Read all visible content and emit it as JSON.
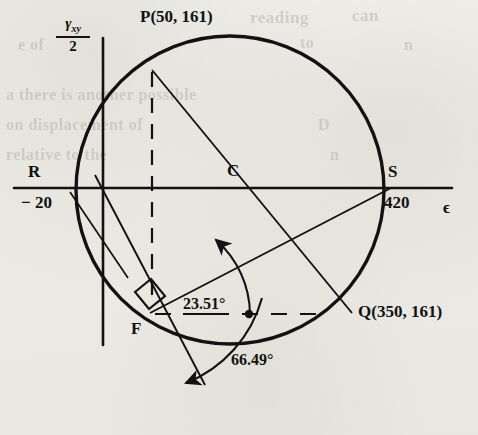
{
  "figure": {
    "kind": "mohr-circle-strain",
    "axis_labels": {
      "vertical_numerator": "γ",
      "vertical_numerator_sub": "xy",
      "vertical_denominator": "2",
      "horizontal": "ϵ"
    },
    "points": [
      {
        "id": "P",
        "label": "P(50, 161)",
        "x": 50,
        "y": 161,
        "px": 152,
        "py": 70
      },
      {
        "id": "Q",
        "label": "Q(350, 161)",
        "x": 350,
        "y": 161,
        "px": 352,
        "py": 313
      },
      {
        "id": "R",
        "label": "R",
        "value_label": "− 20",
        "x": -20,
        "y": 0,
        "px": 68,
        "py": 188
      },
      {
        "id": "S",
        "label": "S",
        "value_label": "420",
        "x": 420,
        "y": 0,
        "px": 391,
        "py": 188
      },
      {
        "id": "C",
        "label": "C",
        "px": 230,
        "py": 188
      },
      {
        "id": "F",
        "label": "F",
        "px": 150,
        "py": 313
      }
    ],
    "angles": [
      {
        "id": "theta1",
        "label": "23.51°",
        "value": 23.51,
        "underlined": true
      },
      {
        "id": "theta2",
        "label": "66.49°",
        "value": 66.49,
        "underlined": false
      }
    ],
    "circle": {
      "center_x": 200,
      "center_y": 0,
      "radius": 220,
      "px_cx": 230,
      "px_cy": 190,
      "px_r": 154
    },
    "colors": {
      "ink": "#121212",
      "paper": "#efeeea",
      "ghost": "#b9b6ac"
    }
  },
  "ghost_text": [
    {
      "t": "reading",
      "x": 250,
      "y": 8,
      "s": 17
    },
    {
      "t": "can",
      "x": 352,
      "y": 6,
      "s": 17
    },
    {
      "t": "e of",
      "x": 18,
      "y": 36,
      "s": 16
    },
    {
      "t": "to",
      "x": 300,
      "y": 34,
      "s": 16
    },
    {
      "t": "n",
      "x": 404,
      "y": 36,
      "s": 16
    },
    {
      "t": "a there is another possible",
      "x": 6,
      "y": 86,
      "s": 16
    },
    {
      "t": "on displacement of",
      "x": 6,
      "y": 116,
      "s": 16
    },
    {
      "t": "relative to the",
      "x": 6,
      "y": 146,
      "s": 16
    },
    {
      "t": "D",
      "x": 318,
      "y": 116,
      "s": 16
    },
    {
      "t": "n",
      "x": 330,
      "y": 146,
      "s": 16
    }
  ]
}
